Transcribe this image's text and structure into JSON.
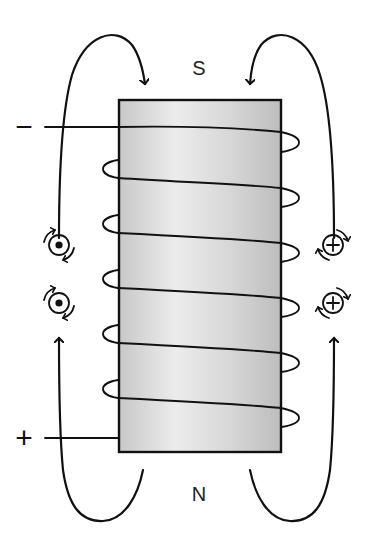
{
  "diagram": {
    "pole_labels": {
      "top": "S",
      "bottom": "N"
    },
    "terminals": {
      "top": "−",
      "bottom": "+"
    },
    "core": {
      "fill_light": "#eeeeee",
      "fill_dark": "#bdbdbd",
      "outline": "#111111"
    },
    "coil_turns": 6,
    "field_lines": [
      {
        "side": "left",
        "direction": "from N to S (upward on outside, into top)"
      },
      {
        "side": "right",
        "direction": "from N to S (upward on outside, into top)"
      }
    ],
    "current_symbols": {
      "left": {
        "symbol": "dot",
        "meaning": "current out of page",
        "count": 2
      },
      "right": {
        "symbol": "cross",
        "meaning": "current into page",
        "count": 2
      }
    },
    "colors": {
      "line": "#111111",
      "background": "#ffffff"
    }
  }
}
